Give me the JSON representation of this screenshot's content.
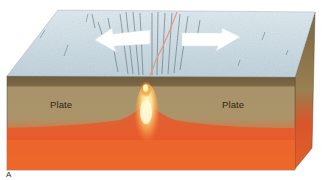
{
  "figure": {
    "panel_label": "A",
    "labels": {
      "left_plate": "Plate",
      "right_plate": "Plate"
    },
    "arrows": [
      {
        "direction": "left",
        "meaning": "plate motion"
      },
      {
        "direction": "right",
        "meaning": "plate motion"
      }
    ],
    "colors": {
      "surface": "#c9dce6",
      "surface_shadow": "#9fb3bf",
      "crust_band": "#6b5a3a",
      "plate": "#a8936a",
      "mantle": "#e8552a",
      "mantle_deep": "#f06a24",
      "magma_core": "#fff6c8",
      "side_face": "#8a7448",
      "background": "#ffffff"
    }
  }
}
